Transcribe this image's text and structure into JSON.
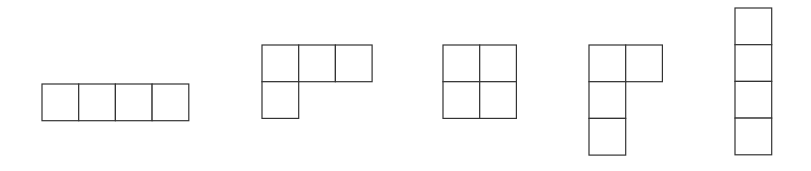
{
  "figure": {
    "stroke_color": "#333333",
    "fill_color": "#ffffff"
  },
  "shapes": [
    {
      "name": "straight-horizontal",
      "cells": [
        [
          0,
          0
        ],
        [
          1,
          0
        ],
        [
          2,
          0
        ],
        [
          3,
          0
        ]
      ]
    },
    {
      "name": "l-shape",
      "cells": [
        [
          0,
          0
        ],
        [
          1,
          0
        ],
        [
          2,
          0
        ],
        [
          0,
          1
        ]
      ]
    },
    {
      "name": "square",
      "cells": [
        [
          0,
          0
        ],
        [
          1,
          0
        ],
        [
          0,
          1
        ],
        [
          1,
          1
        ]
      ]
    },
    {
      "name": "l-shape-vertical",
      "cells": [
        [
          0,
          0
        ],
        [
          1,
          0
        ],
        [
          0,
          1
        ],
        [
          0,
          2
        ]
      ]
    },
    {
      "name": "straight-vertical",
      "cells": [
        [
          0,
          0
        ],
        [
          0,
          1
        ],
        [
          0,
          2
        ],
        [
          0,
          3
        ]
      ]
    }
  ]
}
